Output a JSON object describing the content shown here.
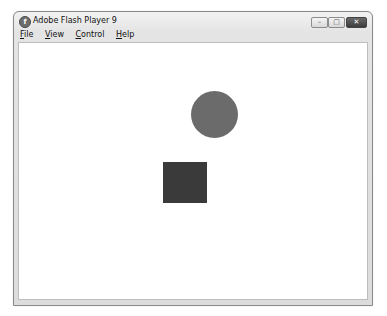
{
  "window": {
    "title": "Adobe Flash Player 9",
    "controls": {
      "minimize": "–",
      "maximize": "□",
      "close": "✕"
    }
  },
  "menubar": {
    "items": [
      {
        "label": "File",
        "accel": "F",
        "rest": "ile"
      },
      {
        "label": "View",
        "accel": "V",
        "rest": "iew"
      },
      {
        "label": "Control",
        "accel": "C",
        "rest": "ontrol"
      },
      {
        "label": "Help",
        "accel": "H",
        "rest": "elp"
      }
    ]
  },
  "stage": {
    "shapes": [
      {
        "type": "circle",
        "color": "#6b6b6b"
      },
      {
        "type": "square",
        "color": "#3a3a3a"
      }
    ]
  }
}
